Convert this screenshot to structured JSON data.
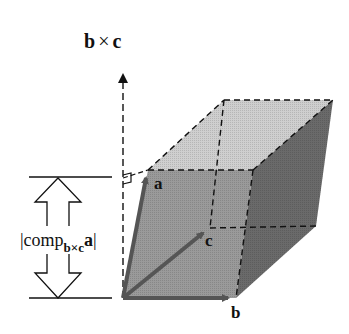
{
  "figure": {
    "normal_label": {
      "b": "b",
      "times": "×",
      "c": "c"
    },
    "vector_labels": {
      "a": "a",
      "b": "b",
      "c": "c"
    },
    "component_label": {
      "open_bar": "|",
      "comp": "comp",
      "subscript": "b×c",
      "a": "a",
      "close_bar": "|"
    },
    "colors": {
      "front_face": "#9a9a9a",
      "top_face": "#cfcfcf",
      "side_face": "#6a6a6a",
      "vector": "#555555",
      "line": "#111111"
    }
  }
}
